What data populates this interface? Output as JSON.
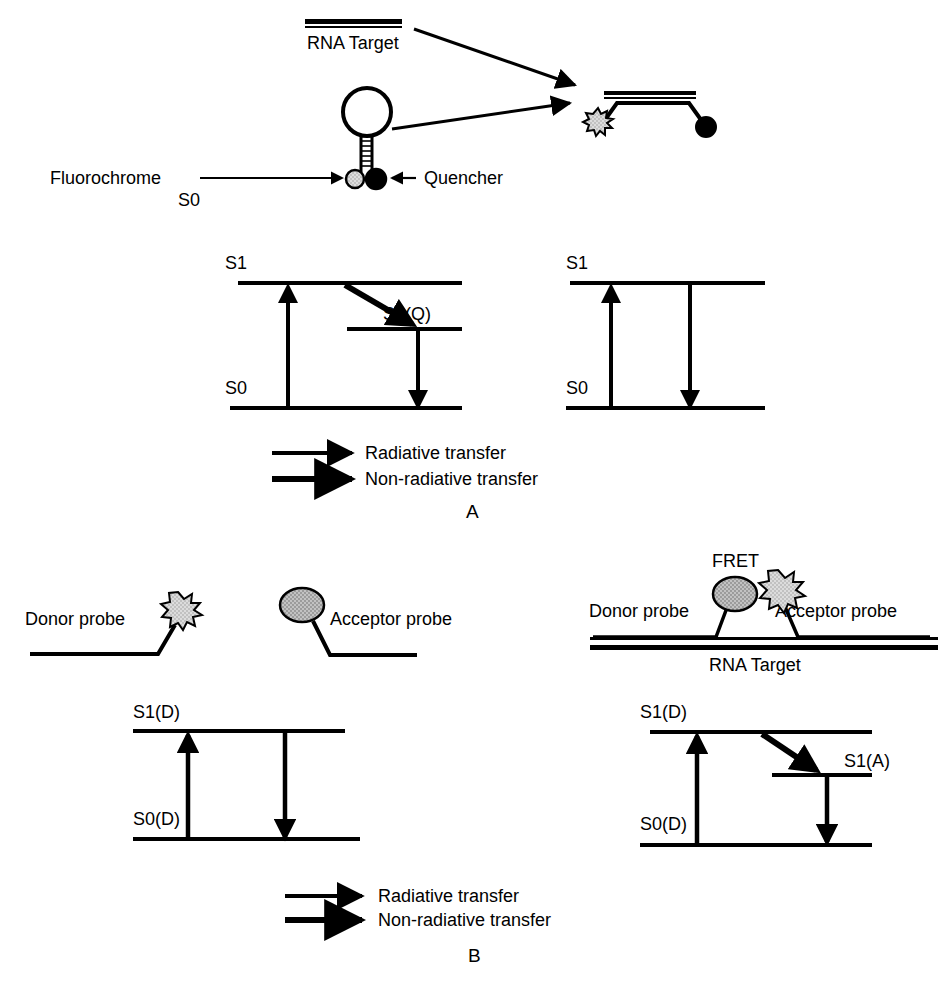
{
  "figure": {
    "title_semantic": "Molecular beacon and FRET probe hybridization with Jablonski energy level diagrams",
    "background_color": "#ffffff",
    "ink_color": "#000000",
    "fluorochrome_fill": "#d9d9d9",
    "acceptor_fill": "#b3b3b3",
    "quencher_fill": "#000000"
  },
  "panel_a": {
    "letter": "A",
    "schematic": {
      "rna_target_label": "RNA Target",
      "fluorochrome_label": "Fluorochrome",
      "ground_state_label": "S0",
      "quencher_label": "Quencher"
    },
    "energy_left": {
      "excited_label": "S1",
      "ground_label": "S0",
      "quencher_excited_label": "S1(Q)"
    },
    "energy_right": {
      "excited_label": "S1",
      "ground_label": "S0"
    },
    "legend": [
      {
        "label": "Radiative transfer",
        "arrow": "thin-shaft-solid-head"
      },
      {
        "label": "Non-radiative transfer",
        "arrow": "thick-shaft-solid-head"
      }
    ]
  },
  "panel_b": {
    "letter": "B",
    "schematic_left": {
      "donor_probe_label": "Donor probe",
      "acceptor_probe_label": "Acceptor probe"
    },
    "schematic_right": {
      "fret_label": "FRET",
      "donor_probe_label": "Donor probe",
      "acceptor_probe_label": "Acceptor probe",
      "rna_target_label": "RNA Target"
    },
    "energy_left": {
      "excited_label": "S1(D)",
      "ground_label": "S0(D)"
    },
    "energy_right": {
      "excited_label": "S1(D)",
      "ground_label": "S0(D)",
      "acceptor_excited_label": "S1(A)"
    },
    "legend": [
      {
        "label": "Radiative transfer",
        "arrow": "thin-shaft-solid-head"
      },
      {
        "label": "Non-radiative transfer",
        "arrow": "thick-shaft-solid-head"
      }
    ]
  }
}
